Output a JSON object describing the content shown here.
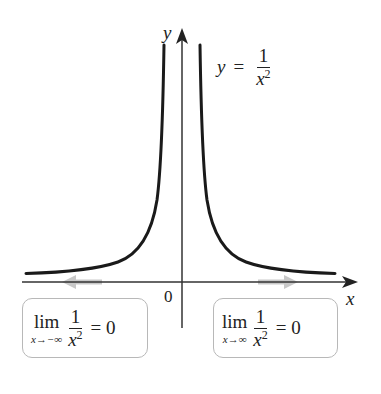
{
  "figure": {
    "x_axis_label": "x",
    "y_axis_label": "y",
    "origin_label": "0",
    "equation": {
      "lhs": "y",
      "equals": "=",
      "numerator": "1",
      "denominator_base": "x",
      "denominator_exponent": "2"
    },
    "limit_left": {
      "word": "lim",
      "subscript": "x→−∞",
      "numerator": "1",
      "denominator_base": "x",
      "denominator_exponent": "2",
      "result": "= 0"
    },
    "limit_right": {
      "word": "lim",
      "subscript": "x→∞",
      "numerator": "1",
      "denominator_base": "x",
      "denominator_exponent": "2",
      "result": "= 0"
    },
    "colors": {
      "curve": "#1a1a1a",
      "axes": "#333333",
      "approach_arrows": "#c8c8c8",
      "box_border": "#b8b8b8"
    }
  }
}
